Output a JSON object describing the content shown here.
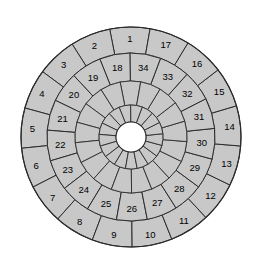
{
  "figure": {
    "name": "concentric-sector-wheel",
    "type": "diagram",
    "background_color": "#ffffff"
  },
  "style": {
    "fill": "#c8c8c8",
    "hub_fill": "#ffffff",
    "stroke": "#2b2b2b",
    "label_color": "#000000",
    "label_font_size": 9.5
  },
  "geometry": {
    "center_x": 131,
    "center_y": 137,
    "radius_outer": 110,
    "radius_mid": 84,
    "radius_inner": 56,
    "radius_core": 32,
    "radius_hub": 15,
    "sector_count_outer": 17,
    "sector_count_mid": 17,
    "sector_count_inner": 17,
    "sector_count_core": 17,
    "outer_start_angle_deg": 80.0,
    "mid_start_angle_deg": 90.6,
    "inner_start_angle_deg": 80.0,
    "core_start_angle_deg": 90.6
  },
  "rings": [
    {
      "name": "outer-ring",
      "index": 0,
      "labeled": true,
      "labels": [
        "1",
        "2",
        "3",
        "4",
        "5",
        "6",
        "7",
        "8",
        "9",
        "10",
        "11",
        "12",
        "13",
        "14",
        "15",
        "16",
        "17"
      ]
    },
    {
      "name": "middle-ring",
      "index": 1,
      "labeled": true,
      "labels": [
        "18",
        "19",
        "20",
        "21",
        "22",
        "23",
        "24",
        "25",
        "26",
        "27",
        "28",
        "29",
        "30",
        "31",
        "32",
        "33",
        "34"
      ]
    },
    {
      "name": "inner-ring",
      "index": 2,
      "labeled": false,
      "labels": []
    },
    {
      "name": "core-ring",
      "index": 3,
      "labeled": false,
      "labels": []
    }
  ],
  "chart_data": {
    "type": "pie",
    "title": "",
    "subtitle": "",
    "xlabel": "",
    "ylabel": "",
    "legend": "none",
    "grid": false,
    "rings": [
      {
        "name": "outer-ring",
        "slices": 17,
        "slice_angle_deg": 21.18,
        "labels": [
          "1",
          "2",
          "3",
          "4",
          "5",
          "6",
          "7",
          "8",
          "9",
          "10",
          "11",
          "12",
          "13",
          "14",
          "15",
          "16",
          "17"
        ],
        "values": [
          1,
          1,
          1,
          1,
          1,
          1,
          1,
          1,
          1,
          1,
          1,
          1,
          1,
          1,
          1,
          1,
          1
        ],
        "r_inner": 84,
        "r_outer": 110
      },
      {
        "name": "middle-ring",
        "slices": 17,
        "slice_angle_deg": 21.18,
        "labels": [
          "18",
          "19",
          "20",
          "21",
          "22",
          "23",
          "24",
          "25",
          "26",
          "27",
          "28",
          "29",
          "30",
          "31",
          "32",
          "33",
          "34"
        ],
        "values": [
          1,
          1,
          1,
          1,
          1,
          1,
          1,
          1,
          1,
          1,
          1,
          1,
          1,
          1,
          1,
          1,
          1
        ],
        "r_inner": 56,
        "r_outer": 84
      },
      {
        "name": "inner-ring",
        "slices": 17,
        "slice_angle_deg": 21.18,
        "labels": [],
        "values": [
          1,
          1,
          1,
          1,
          1,
          1,
          1,
          1,
          1,
          1,
          1,
          1,
          1,
          1,
          1,
          1,
          1
        ],
        "r_inner": 32,
        "r_outer": 56
      },
      {
        "name": "core-ring",
        "slices": 17,
        "slice_angle_deg": 21.18,
        "labels": [],
        "values": [
          1,
          1,
          1,
          1,
          1,
          1,
          1,
          1,
          1,
          1,
          1,
          1,
          1,
          1,
          1,
          1,
          1
        ],
        "r_inner": 15,
        "r_outer": 32
      }
    ]
  }
}
